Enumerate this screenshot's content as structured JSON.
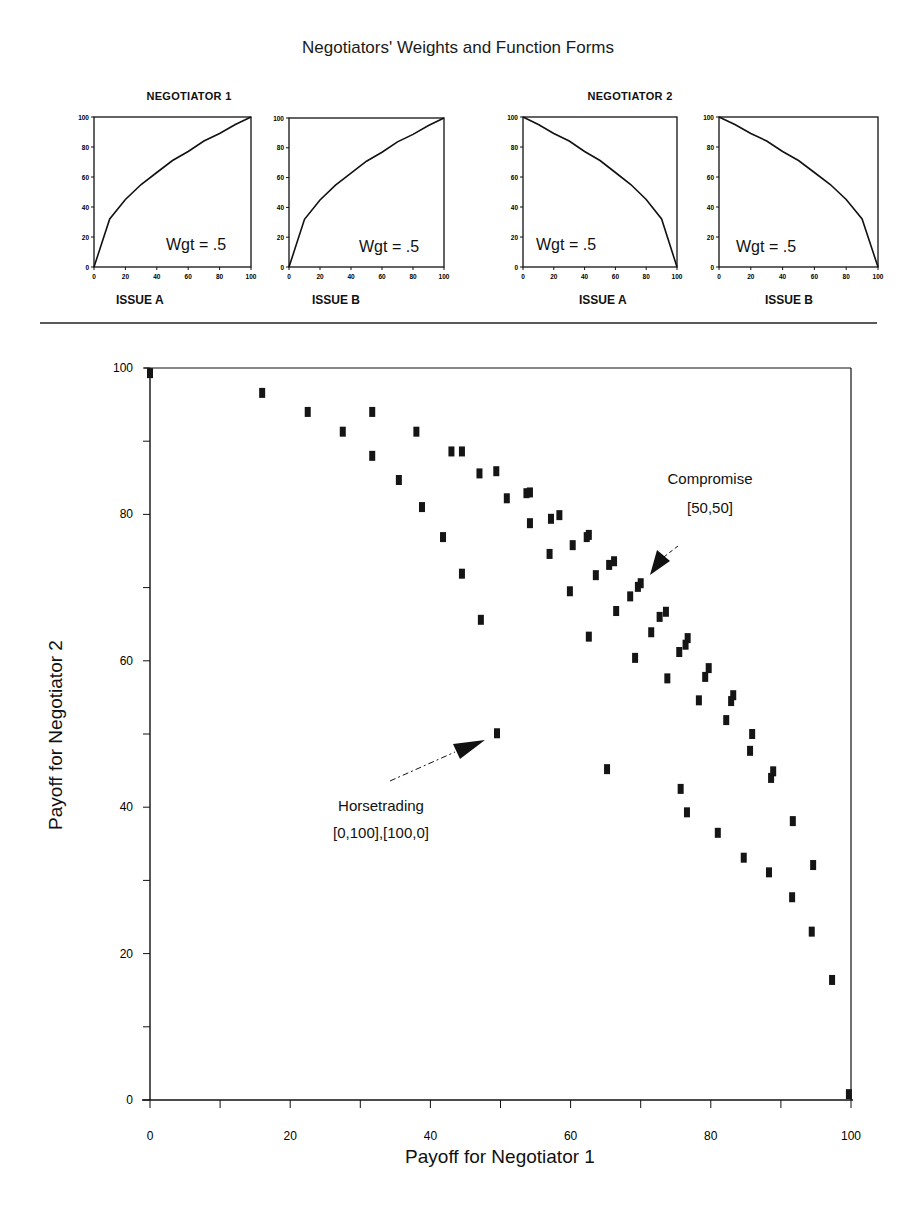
{
  "figure": {
    "title": "Negotiators' Weights and Function Forms",
    "negotiators": [
      {
        "label": "NEGOTIATOR 1",
        "panels": [
          {
            "issue": "ISSUE A",
            "weight_label": "Wgt = .5"
          },
          {
            "issue": "ISSUE B",
            "weight_label": "Wgt = .5"
          }
        ]
      },
      {
        "label": "NEGOTIATOR 2",
        "panels": [
          {
            "issue": "ISSUE A",
            "weight_label": "Wgt = .5"
          },
          {
            "issue": "ISSUE B",
            "weight_label": "Wgt = .5"
          }
        ]
      }
    ],
    "small_axis_ticks": [
      "0",
      "20",
      "40",
      "60",
      "80",
      "100"
    ]
  },
  "annotations": {
    "compromise": {
      "label": "Compromise",
      "coords": "[50,50]"
    },
    "horsetrading": {
      "label": "Horsetrading",
      "coords": "[0,100],[100,0]"
    }
  },
  "chart_data": [
    {
      "type": "line",
      "title": "NEGOTIATOR 1 — ISSUE A",
      "xlabel": "ISSUE A",
      "ylabel": "",
      "xlim": [
        0,
        100
      ],
      "ylim": [
        0,
        100
      ],
      "x": [
        0,
        10,
        20,
        30,
        40,
        50,
        60,
        70,
        80,
        90,
        100
      ],
      "series": [
        {
          "name": "utility",
          "values": [
            0,
            32,
            45,
            55,
            63,
            71,
            77,
            84,
            89,
            95,
            100
          ]
        }
      ],
      "annotation": "Wgt = .5"
    },
    {
      "type": "line",
      "title": "NEGOTIATOR 1 — ISSUE B",
      "xlabel": "ISSUE B",
      "ylabel": "",
      "xlim": [
        0,
        100
      ],
      "ylim": [
        0,
        100
      ],
      "x": [
        0,
        10,
        20,
        30,
        40,
        50,
        60,
        70,
        80,
        90,
        100
      ],
      "series": [
        {
          "name": "utility",
          "values": [
            0,
            32,
            45,
            55,
            63,
            71,
            77,
            84,
            89,
            95,
            100
          ]
        }
      ],
      "annotation": "Wgt = .5"
    },
    {
      "type": "line",
      "title": "NEGOTIATOR 2 — ISSUE A",
      "xlabel": "ISSUE A",
      "ylabel": "",
      "xlim": [
        0,
        100
      ],
      "ylim": [
        0,
        100
      ],
      "x": [
        0,
        10,
        20,
        30,
        40,
        50,
        60,
        70,
        80,
        90,
        100
      ],
      "series": [
        {
          "name": "utility",
          "values": [
            100,
            95,
            89,
            84,
            77,
            71,
            63,
            55,
            45,
            32,
            0
          ]
        }
      ],
      "annotation": "Wgt = .5"
    },
    {
      "type": "line",
      "title": "NEGOTIATOR 2 — ISSUE B",
      "xlabel": "ISSUE B",
      "ylabel": "",
      "xlim": [
        0,
        100
      ],
      "ylim": [
        0,
        100
      ],
      "x": [
        0,
        10,
        20,
        30,
        40,
        50,
        60,
        70,
        80,
        90,
        100
      ],
      "series": [
        {
          "name": "utility",
          "values": [
            100,
            95,
            89,
            84,
            77,
            71,
            63,
            55,
            45,
            32,
            0
          ]
        }
      ],
      "annotation": "Wgt = .5"
    },
    {
      "type": "scatter",
      "title": "",
      "xlabel": "Payoff for Negotiator 1",
      "ylabel": "Payoff for Negotiator 2",
      "xlim": [
        0,
        100
      ],
      "ylim": [
        0,
        100
      ],
      "x_ticks": [
        "0",
        "20",
        "40",
        "60",
        "80",
        "100"
      ],
      "y_ticks": [
        "0",
        "20",
        "40",
        "60",
        "80",
        "100"
      ],
      "grid": false,
      "points": [
        [
          0,
          99.3
        ],
        [
          16,
          96.6
        ],
        [
          22.5,
          94
        ],
        [
          31.7,
          94
        ],
        [
          27.5,
          91.3
        ],
        [
          38,
          91.3
        ],
        [
          31.7,
          88
        ],
        [
          43,
          88.6
        ],
        [
          44.5,
          88.6
        ],
        [
          35.5,
          84.7
        ],
        [
          47,
          85.6
        ],
        [
          49.4,
          85.9
        ],
        [
          38.8,
          81
        ],
        [
          50.9,
          82.2
        ],
        [
          53.7,
          82.9
        ],
        [
          54.2,
          83
        ],
        [
          41.8,
          76.9
        ],
        [
          54.2,
          78.8
        ],
        [
          57.2,
          79.4
        ],
        [
          58.4,
          79.9
        ],
        [
          44.5,
          71.9
        ],
        [
          57,
          74.6
        ],
        [
          60.3,
          75.8
        ],
        [
          62.3,
          76.9
        ],
        [
          62.6,
          77.2
        ],
        [
          47.2,
          65.6
        ],
        [
          59.9,
          69.5
        ],
        [
          63.6,
          71.7
        ],
        [
          65.5,
          73.1
        ],
        [
          66.2,
          73.6
        ],
        [
          62.6,
          63.3
        ],
        [
          66.5,
          66.8
        ],
        [
          68.5,
          68.8
        ],
        [
          69.6,
          70.1
        ],
        [
          70,
          70.6
        ],
        [
          69.2,
          60.4
        ],
        [
          71.5,
          63.9
        ],
        [
          72.7,
          66
        ],
        [
          73.6,
          66.7
        ],
        [
          73.8,
          57.6
        ],
        [
          75.5,
          61.2
        ],
        [
          76.4,
          62.2
        ],
        [
          76.7,
          63.1
        ],
        [
          78.3,
          54.6
        ],
        [
          79.2,
          57.8
        ],
        [
          79.7,
          59
        ],
        [
          82.2,
          51.9
        ],
        [
          82.9,
          54.5
        ],
        [
          83.2,
          55.3
        ],
        [
          49.5,
          50.1
        ],
        [
          85.6,
          47.7
        ],
        [
          85.9,
          50
        ],
        [
          65.2,
          45.2
        ],
        [
          88.6,
          44
        ],
        [
          88.9,
          44.9
        ],
        [
          75.7,
          42.5
        ],
        [
          76.6,
          39.3
        ],
        [
          91.7,
          38.1
        ],
        [
          81,
          36.5
        ],
        [
          84.7,
          33.1
        ],
        [
          94.6,
          32.1
        ],
        [
          88.3,
          31.1
        ],
        [
          91.6,
          27.7
        ],
        [
          94.4,
          23
        ],
        [
          97.3,
          16.4
        ],
        [
          99.7,
          0.8
        ]
      ],
      "annotations": [
        {
          "text": "Compromise [50,50]",
          "arrow_to": [
            70,
            70.6
          ]
        },
        {
          "text": "Horsetrading [0,100],[100,0]",
          "arrow_to": [
            49.5,
            50.1
          ]
        }
      ]
    }
  ]
}
